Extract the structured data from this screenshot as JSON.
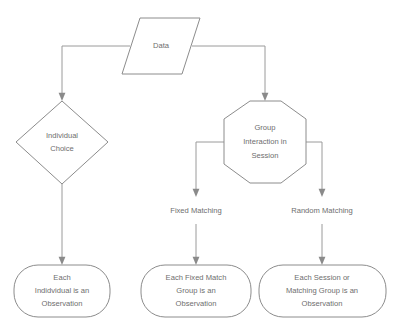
{
  "diagram": {
    "type": "flowchart",
    "colors": {
      "background": "#ffffff",
      "stroke": "#8c8c8c",
      "edge": "#9a9a9a",
      "text": "#6e6e6e"
    },
    "nodes": [
      {
        "id": "data",
        "shape": "parallelogram",
        "lines": [
          "Data"
        ],
        "line1": "Data"
      },
      {
        "id": "individual-choice",
        "shape": "diamond",
        "lines": [
          "Individual",
          "Choice"
        ],
        "line1": "Individual",
        "line2": "Choice"
      },
      {
        "id": "group-interaction",
        "shape": "octagon",
        "lines": [
          "Group",
          "Interaction in",
          "Session"
        ],
        "line1": "Group",
        "line2": "Interaction in",
        "line3": "Session"
      },
      {
        "id": "individual-observation",
        "shape": "rounded-rectangle",
        "lines": [
          "Each",
          "Indidvidual is an",
          "Observation"
        ],
        "line1": "Each",
        "line2": "Indidvidual is an",
        "line3": "Observation"
      },
      {
        "id": "fixed-match-observation",
        "shape": "rounded-rectangle",
        "lines": [
          "Each Fixed Match",
          "Group is an",
          "Observation"
        ],
        "line1": "Each Fixed Match",
        "line2": "Group is an",
        "line3": "Observation"
      },
      {
        "id": "session-observation",
        "shape": "rounded-rectangle",
        "lines": [
          "Each Session or",
          "Matching Group is an",
          "Observation"
        ],
        "line1": "Each Session or",
        "line2": "Matching Group is an",
        "line3": "Observation"
      }
    ],
    "edge_labels": [
      {
        "id": "fixed-matching",
        "text": "Fixed Matching"
      },
      {
        "id": "random-matching",
        "text": "Random Matching"
      }
    ],
    "edges": [
      {
        "from": "data",
        "to": "individual-choice",
        "label": ""
      },
      {
        "from": "data",
        "to": "group-interaction",
        "label": ""
      },
      {
        "from": "individual-choice",
        "to": "individual-observation",
        "label": ""
      },
      {
        "from": "group-interaction",
        "to": "fixed-match-observation",
        "label": "Fixed Matching"
      },
      {
        "from": "group-interaction",
        "to": "session-observation",
        "label": "Random Matching"
      }
    ]
  }
}
